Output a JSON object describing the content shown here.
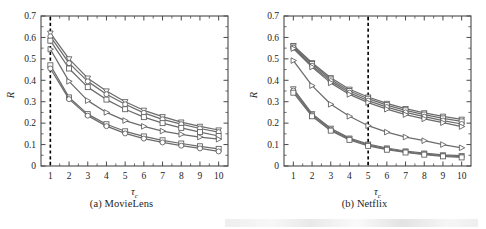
{
  "figure": {
    "panels": [
      {
        "id": "a",
        "caption": "(a) MovieLens",
        "dataset": "MovieLens"
      },
      {
        "id": "b",
        "caption": "(b) Netflix",
        "dataset": "Netflix"
      }
    ]
  },
  "chart_data": [
    {
      "type": "line",
      "panel": "a",
      "title": "(a) MovieLens",
      "xlabel": "τc",
      "ylabel": "R",
      "xlim": [
        0.5,
        10.5
      ],
      "ylim": [
        0,
        0.7
      ],
      "xticks": [
        1,
        2,
        3,
        4,
        5,
        6,
        7,
        8,
        9,
        10
      ],
      "yticks": [
        0,
        0.1,
        0.2,
        0.3,
        0.4,
        0.5,
        0.6,
        0.7
      ],
      "grid": false,
      "legend": "none",
      "annotations": [
        {
          "type": "vline",
          "x": 1,
          "style": "dashed",
          "color": "#000000",
          "label": "optimal tau_c = 1"
        }
      ],
      "x": [
        1,
        2,
        3,
        4,
        5,
        6,
        7,
        8,
        9,
        10
      ],
      "series": [
        {
          "name": "series-1",
          "marker": "triangle-down",
          "values": [
            0.62,
            0.5,
            0.41,
            0.35,
            0.3,
            0.26,
            0.23,
            0.205,
            0.185,
            0.168
          ]
        },
        {
          "name": "series-2",
          "marker": "circle",
          "values": [
            0.605,
            0.48,
            0.395,
            0.335,
            0.288,
            0.248,
            0.218,
            0.195,
            0.175,
            0.158
          ]
        },
        {
          "name": "series-3",
          "marker": "square",
          "values": [
            0.585,
            0.455,
            0.368,
            0.31,
            0.265,
            0.228,
            0.2,
            0.178,
            0.158,
            0.14
          ]
        },
        {
          "name": "series-4",
          "marker": "triangle-right",
          "values": [
            0.545,
            0.395,
            0.305,
            0.25,
            0.212,
            0.185,
            0.163,
            0.148,
            0.135,
            0.125
          ]
        },
        {
          "name": "series-5",
          "marker": "square",
          "values": [
            0.47,
            0.32,
            0.242,
            0.195,
            0.162,
            0.138,
            0.12,
            0.105,
            0.092,
            0.08
          ]
        },
        {
          "name": "series-6",
          "marker": "circle",
          "values": [
            0.455,
            0.312,
            0.235,
            0.186,
            0.152,
            0.128,
            0.11,
            0.095,
            0.082,
            0.068
          ]
        }
      ]
    },
    {
      "type": "line",
      "panel": "b",
      "title": "(b) Netflix",
      "xlabel": "τc",
      "ylabel": "R",
      "xlim": [
        0.5,
        10.5
      ],
      "ylim": [
        0,
        0.7
      ],
      "xticks": [
        1,
        2,
        3,
        4,
        5,
        6,
        7,
        8,
        9,
        10
      ],
      "yticks": [
        0,
        0.1,
        0.2,
        0.3,
        0.4,
        0.5,
        0.6,
        0.7
      ],
      "grid": false,
      "legend": "none",
      "annotations": [
        {
          "type": "vline",
          "x": 5,
          "style": "dashed",
          "color": "#000000",
          "label": "optimal tau_c = 5"
        }
      ],
      "x": [
        1,
        2,
        3,
        4,
        5,
        6,
        7,
        8,
        9,
        10
      ],
      "series": [
        {
          "name": "series-1",
          "marker": "triangle-down",
          "values": [
            0.562,
            0.482,
            0.412,
            0.358,
            0.322,
            0.292,
            0.268,
            0.248,
            0.232,
            0.218
          ]
        },
        {
          "name": "series-2",
          "marker": "square",
          "values": [
            0.558,
            0.476,
            0.404,
            0.35,
            0.314,
            0.284,
            0.26,
            0.24,
            0.222,
            0.208
          ]
        },
        {
          "name": "series-3",
          "marker": "circle",
          "values": [
            0.552,
            0.468,
            0.396,
            0.342,
            0.305,
            0.275,
            0.25,
            0.23,
            0.212,
            0.196
          ]
        },
        {
          "name": "series-4",
          "marker": "triangle-right",
          "values": [
            0.548,
            0.462,
            0.388,
            0.334,
            0.296,
            0.265,
            0.24,
            0.22,
            0.202,
            0.184
          ]
        },
        {
          "name": "series-5",
          "marker": "triangle-right",
          "values": [
            0.492,
            0.375,
            0.288,
            0.232,
            0.188,
            0.158,
            0.135,
            0.118,
            0.1,
            0.085
          ]
        },
        {
          "name": "series-6",
          "marker": "triangle-down",
          "values": [
            0.36,
            0.244,
            0.176,
            0.13,
            0.102,
            0.084,
            0.07,
            0.06,
            0.052,
            0.048
          ]
        },
        {
          "name": "series-7",
          "marker": "circle",
          "values": [
            0.352,
            0.238,
            0.17,
            0.126,
            0.098,
            0.08,
            0.066,
            0.056,
            0.048,
            0.044
          ]
        },
        {
          "name": "series-8",
          "marker": "square",
          "values": [
            0.342,
            0.232,
            0.165,
            0.122,
            0.094,
            0.076,
            0.063,
            0.053,
            0.045,
            0.04
          ]
        }
      ]
    }
  ],
  "style": {
    "line_color": "#6b6b6b",
    "marker_edge": "#5a5a5a",
    "marker_fill": "#ffffff",
    "axis_color": "#4a4a4a",
    "text_color": "#1d1d1d"
  }
}
